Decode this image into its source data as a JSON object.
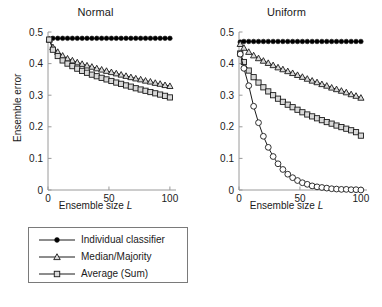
{
  "figure": {
    "width": 382,
    "height": 307,
    "background": "#ffffff",
    "line_color": "#1a1a1a",
    "marker_fill_open": "#d9d9d9",
    "marker_fill_solid": "#000000"
  },
  "panels": [
    {
      "id": "normal",
      "title": "Normal",
      "xlabel_prefix": "Ensemble size ",
      "xlabel_symbol": "L",
      "ylabel": "Ensemble error",
      "legend": [
        {
          "label": "Individual classifier",
          "marker": "filled-circle"
        },
        {
          "label": "Median/Majority",
          "marker": "open-triangle"
        },
        {
          "label": "Average (Sum)",
          "marker": "open-square"
        }
      ]
    },
    {
      "id": "uniform",
      "title": "Uniform",
      "xlabel_prefix": "Ensemble size ",
      "xlabel_symbol": "L",
      "ylabel": "Ensemble error",
      "legend": [
        {
          "label": "Individual classifier",
          "marker": "filled-circle"
        },
        {
          "label": "Median/Majority",
          "marker": "open-triangle"
        },
        {
          "label": "Average (Sum)",
          "marker": "open-square"
        },
        {
          "label": "Min/Max",
          "marker": "open-circle"
        }
      ]
    }
  ],
  "chart_data": [
    {
      "type": "line",
      "title": "Normal",
      "xlabel": "Ensemble size L",
      "ylabel": "Ensemble error",
      "xlim": [
        0,
        105
      ],
      "ylim": [
        0,
        0.5
      ],
      "xticks": [
        0,
        50,
        100
      ],
      "xtick_labels": [
        "0",
        "50",
        "100"
      ],
      "yticks": [
        0,
        0.1,
        0.2,
        0.3,
        0.4,
        0.5
      ],
      "ytick_labels": [
        "0",
        "0.1",
        "0.2",
        "0.3",
        "0.4",
        "0.5"
      ],
      "grid": false,
      "legend_position": "below",
      "x": [
        1,
        4,
        8,
        12,
        16,
        20,
        24,
        28,
        32,
        36,
        40,
        44,
        48,
        52,
        56,
        60,
        64,
        68,
        72,
        76,
        80,
        84,
        88,
        92,
        96,
        100
      ],
      "series": [
        {
          "name": "Individual classifier",
          "marker": "filled-circle",
          "values": [
            0.476,
            0.48,
            0.48,
            0.48,
            0.48,
            0.48,
            0.48,
            0.48,
            0.48,
            0.48,
            0.48,
            0.48,
            0.48,
            0.48,
            0.48,
            0.48,
            0.48,
            0.48,
            0.48,
            0.48,
            0.48,
            0.48,
            0.48,
            0.48,
            0.48,
            0.48
          ]
        },
        {
          "name": "Median/Majority",
          "marker": "open-triangle",
          "values": [
            0.476,
            0.452,
            0.437,
            0.425,
            0.416,
            0.41,
            0.404,
            0.399,
            0.394,
            0.39,
            0.385,
            0.381,
            0.377,
            0.373,
            0.369,
            0.365,
            0.361,
            0.357,
            0.353,
            0.35,
            0.346,
            0.343,
            0.339,
            0.336,
            0.332,
            0.329
          ]
        },
        {
          "name": "Average (Sum)",
          "marker": "open-square",
          "values": [
            0.476,
            0.444,
            0.424,
            0.41,
            0.4,
            0.392,
            0.384,
            0.377,
            0.371,
            0.365,
            0.36,
            0.355,
            0.35,
            0.345,
            0.34,
            0.336,
            0.331,
            0.327,
            0.322,
            0.318,
            0.314,
            0.31,
            0.306,
            0.302,
            0.298,
            0.293
          ]
        }
      ]
    },
    {
      "type": "line",
      "title": "Uniform",
      "xlabel": "Ensemble size L",
      "ylabel": "Ensemble error",
      "xlim": [
        0,
        105
      ],
      "ylim": [
        0,
        0.5
      ],
      "xticks": [
        0,
        50,
        100
      ],
      "xtick_labels": [
        "0",
        "50",
        "100"
      ],
      "yticks": [
        0,
        0.1,
        0.2,
        0.3,
        0.4,
        0.5
      ],
      "ytick_labels": [
        "0",
        "0.1",
        "0.2",
        "0.3",
        "0.4",
        "0.5"
      ],
      "grid": false,
      "legend_position": "below",
      "x": [
        1,
        4,
        8,
        12,
        16,
        20,
        24,
        28,
        32,
        36,
        40,
        44,
        48,
        52,
        56,
        60,
        64,
        68,
        72,
        76,
        80,
        84,
        88,
        92,
        96,
        100
      ],
      "series": [
        {
          "name": "Individual classifier",
          "marker": "filled-circle",
          "values": [
            0.468,
            0.47,
            0.47,
            0.47,
            0.47,
            0.47,
            0.47,
            0.47,
            0.47,
            0.47,
            0.47,
            0.47,
            0.47,
            0.47,
            0.47,
            0.47,
            0.47,
            0.47,
            0.47,
            0.47,
            0.47,
            0.47,
            0.47,
            0.47,
            0.47,
            0.47
          ]
        },
        {
          "name": "Median/Majority",
          "marker": "open-triangle",
          "values": [
            0.462,
            0.45,
            0.437,
            0.426,
            0.417,
            0.409,
            0.402,
            0.395,
            0.388,
            0.382,
            0.376,
            0.37,
            0.364,
            0.358,
            0.352,
            0.346,
            0.341,
            0.335,
            0.33,
            0.324,
            0.319,
            0.314,
            0.309,
            0.303,
            0.298,
            0.292
          ]
        },
        {
          "name": "Average (Sum)",
          "marker": "open-square",
          "values": [
            0.432,
            0.405,
            0.378,
            0.357,
            0.34,
            0.325,
            0.312,
            0.3,
            0.289,
            0.279,
            0.27,
            0.262,
            0.254,
            0.246,
            0.239,
            0.233,
            0.227,
            0.221,
            0.215,
            0.21,
            0.204,
            0.199,
            0.194,
            0.189,
            0.183,
            0.172
          ]
        },
        {
          "name": "Min/Max",
          "marker": "open-circle",
          "values": [
            0.43,
            0.385,
            0.33,
            0.265,
            0.213,
            0.17,
            0.135,
            0.106,
            0.083,
            0.065,
            0.05,
            0.039,
            0.03,
            0.023,
            0.018,
            0.013,
            0.01,
            0.008,
            0.006,
            0.004,
            0.003,
            0.002,
            0.002,
            0.001,
            0.001,
            0.0
          ]
        }
      ]
    }
  ]
}
